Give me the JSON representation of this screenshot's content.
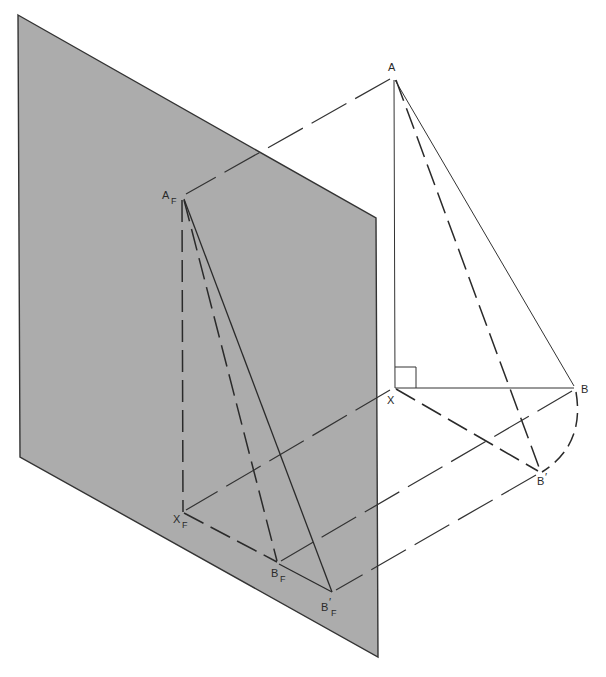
{
  "diagram": {
    "plane": {
      "name": "frontal projection plane F",
      "fill": "#acacac",
      "edge": "#333333",
      "corners": [
        [
          18,
          15
        ],
        [
          376,
          218
        ],
        [
          378,
          657
        ],
        [
          20,
          457
        ]
      ]
    },
    "points": {
      "A": {
        "label": "A",
        "sub": "",
        "prime": "",
        "x": 394,
        "y": 77
      },
      "X": {
        "label": "X",
        "sub": "",
        "prime": "",
        "x": 395,
        "y": 388
      },
      "B": {
        "label": "B",
        "sub": "",
        "prime": "",
        "x": 576,
        "y": 388
      },
      "Bp": {
        "label": "B",
        "sub": "",
        "prime": "′",
        "x": 540,
        "y": 472
      },
      "AF": {
        "label": "A",
        "sub": "F",
        "prime": "",
        "x": 182,
        "y": 197
      },
      "XF": {
        "label": "X",
        "sub": "F",
        "prime": "",
        "x": 183,
        "y": 512
      },
      "BF": {
        "label": "B",
        "sub": "F",
        "prime": "",
        "x": 278,
        "y": 563
      },
      "BpF": {
        "label": "B",
        "sub": "F",
        "prime": "′",
        "x": 332,
        "y": 592
      }
    },
    "labels": {
      "A": "A",
      "X": "X",
      "B": "B",
      "Bp": "B",
      "Bp_prime": "′",
      "AF": "A",
      "AF_sub": "F",
      "XF": "X",
      "XF_sub": "F",
      "BF": "B",
      "BF_sub": "F",
      "BpF": "B",
      "BpF_prime": "′",
      "BpF_sub": "F"
    },
    "segments": [
      {
        "from": "A",
        "to": "X",
        "style": "solid"
      },
      {
        "from": "A",
        "to": "B",
        "style": "solid"
      },
      {
        "from": "X",
        "to": "B",
        "style": "solid"
      },
      {
        "from": "A",
        "to": "Bp",
        "style": "dashed"
      },
      {
        "from": "X",
        "to": "Bp",
        "style": "dashed"
      },
      {
        "from": "B",
        "to": "Bp",
        "style": "dashed-arc"
      },
      {
        "from": "AF",
        "to": "XF",
        "style": "dashed"
      },
      {
        "from": "AF",
        "to": "BF",
        "style": "dashed"
      },
      {
        "from": "AF",
        "to": "BpF",
        "style": "solid"
      },
      {
        "from": "XF",
        "to": "BF",
        "style": "dashed"
      },
      {
        "from": "BF",
        "to": "BpF",
        "style": "solid"
      },
      {
        "from": "A",
        "to": "AF",
        "style": "projector"
      },
      {
        "from": "X",
        "to": "XF",
        "style": "projector"
      },
      {
        "from": "B",
        "to": "BF",
        "style": "projector"
      },
      {
        "from": "Bp",
        "to": "BpF",
        "style": "projector"
      }
    ],
    "right_angle_marker": {
      "at": "X",
      "size": 21
    }
  }
}
